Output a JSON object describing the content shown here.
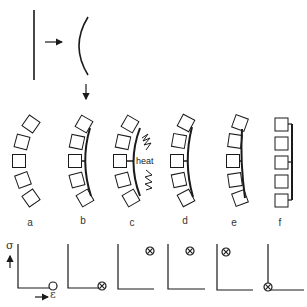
{
  "figure": {
    "panel_labels": [
      "a",
      "b",
      "c",
      "d",
      "e",
      "f"
    ],
    "heat_label": "heat",
    "axis_labels": {
      "y": "σ",
      "x": "ε"
    },
    "colors": {
      "stroke": "#1a1a1a",
      "background": "#ffffff"
    },
    "graphs": [
      {
        "panel": "a",
        "marker": "open-circle",
        "position": "bottom-right"
      },
      {
        "panel": "b",
        "marker": "circle-x",
        "position": "bottom-right"
      },
      {
        "panel": "c",
        "marker": "circle-x",
        "position": "top-right"
      },
      {
        "panel": "d",
        "marker": "circle-x",
        "position": "top-middle"
      },
      {
        "panel": "e",
        "marker": "circle-x",
        "position": "top-left"
      },
      {
        "panel": "f",
        "marker": "circle-x",
        "position": "origin"
      }
    ]
  }
}
